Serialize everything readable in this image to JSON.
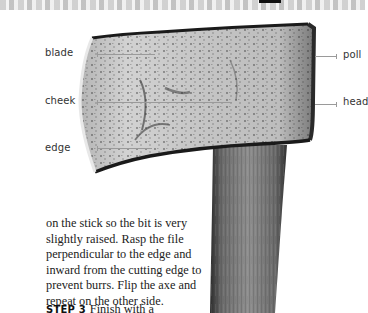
{
  "diagram": {
    "subject": "axe",
    "labels": {
      "blade": "blade",
      "cheek": "cheek",
      "edge": "edge",
      "poll": "poll",
      "head": "head"
    }
  },
  "body": {
    "paragraph": "on the stick so the bit is very slightly raised. Rasp the file perpendicular to the edge and inward from the cutting edge to prevent burrs. Flip the axe and repeat on the other side.",
    "step": {
      "label": "STEP 3",
      "text": "Finish with a"
    }
  }
}
